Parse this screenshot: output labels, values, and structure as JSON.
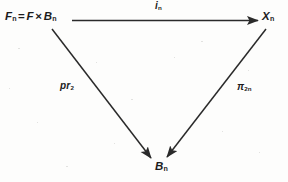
{
  "diagram": {
    "type": "commutative-triangle",
    "background_color": "#fdfdfc",
    "ink_color": "#1c1c1c",
    "vertices": {
      "left": {
        "name": "F_n = F x B_n",
        "base": "F",
        "sub": "n",
        "equals": "=",
        "product_left": "F",
        "times": "×",
        "product_right": "B",
        "product_right_sub": "n"
      },
      "right": {
        "name": "X_n",
        "base": "X",
        "sub": "n"
      },
      "bottom": {
        "name": "B_n",
        "base": "B",
        "sub": "n"
      }
    },
    "arrows": {
      "top": {
        "label": "i_n",
        "base": "i",
        "sub": "n",
        "from": "F_n = F x B_n",
        "to": "X_n",
        "direction": "left-to-right"
      },
      "left_diagonal": {
        "label": "pr_2",
        "base": "pr",
        "sub": "2",
        "from": "F_n = F x B_n",
        "to": "B_n",
        "direction": "down-right"
      },
      "right_diagonal": {
        "label": "pi_2n",
        "base": "π",
        "sub": "2n",
        "from": "X_n",
        "to": "B_n",
        "direction": "down-left"
      }
    }
  }
}
